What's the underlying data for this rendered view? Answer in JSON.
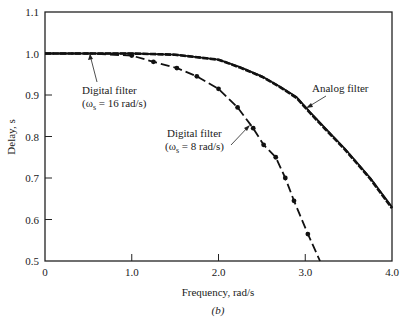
{
  "chart_data": {
    "type": "line",
    "title": "",
    "caption": "(b)",
    "xlabel": "Frequency, rad/s",
    "ylabel": "Delay, s",
    "xlim": [
      0,
      4.0
    ],
    "ylim": [
      0.5,
      1.1
    ],
    "xticks": [
      0,
      1.0,
      2.0,
      3.0,
      4.0
    ],
    "xtick_labels": [
      "0",
      "1.0",
      "2.0",
      "3.0",
      "4.0"
    ],
    "yticks": [
      0.5,
      0.6,
      0.7,
      0.8,
      0.9,
      1.0,
      1.1
    ],
    "ytick_labels": [
      "0.5",
      "0.6",
      "0.7",
      "0.8",
      "0.9",
      "1.0",
      "1.1"
    ],
    "grid": false,
    "legend": "none (inline annotations)",
    "series": [
      {
        "name": "Analog filter",
        "style": "solid",
        "x": [
          0,
          0.5,
          1.0,
          1.5,
          2.0,
          2.25,
          2.5,
          2.71,
          2.9,
          3.05,
          3.23,
          3.46,
          3.75,
          4.0
        ],
        "y": [
          1.0,
          1.0,
          1.0,
          0.997,
          0.985,
          0.967,
          0.945,
          0.92,
          0.895,
          0.86,
          0.82,
          0.77,
          0.7,
          0.63
        ]
      },
      {
        "name": "Digital filter (ωs = 16 rad/s)",
        "style": "dashed",
        "x": [
          0,
          0.5,
          1.0,
          1.5,
          2.0,
          2.25,
          2.5,
          2.71,
          2.9,
          3.05,
          3.23,
          3.46,
          3.75,
          4.0
        ],
        "y": [
          1.0,
          1.0,
          1.0,
          0.997,
          0.985,
          0.966,
          0.944,
          0.919,
          0.893,
          0.858,
          0.818,
          0.768,
          0.698,
          0.627
        ]
      },
      {
        "name": "Digital filter (ωs = 8 rad/s)",
        "style": "dash-dot with markers",
        "x": [
          0,
          0.5,
          1.0,
          1.25,
          1.52,
          1.75,
          2.0,
          2.22,
          2.4,
          2.52,
          2.66,
          2.77,
          2.87,
          3.03,
          3.17
        ],
        "y": [
          1.0,
          1.0,
          0.995,
          0.98,
          0.965,
          0.945,
          0.915,
          0.87,
          0.82,
          0.78,
          0.75,
          0.7,
          0.645,
          0.565,
          0.5
        ]
      }
    ],
    "annotations": [
      {
        "line1": "Digital filter",
        "line2": "(ω",
        "sub": "s",
        "line2_rest": " = 16 rad/s)"
      },
      {
        "line1": "Analog filter"
      },
      {
        "line1": "Digital filter",
        "line2": "(ω",
        "sub": "s",
        "line2_rest": " = 8 rad/s)"
      }
    ]
  }
}
